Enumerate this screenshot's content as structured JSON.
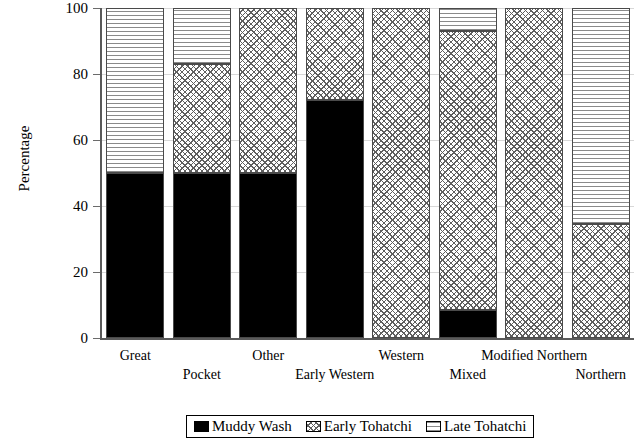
{
  "chart_data": {
    "type": "bar",
    "subtype": "stacked-100-percent",
    "title": "",
    "xlabel": "",
    "ylabel": "Percentage",
    "ylim": [
      0,
      100
    ],
    "yticks": [
      0,
      20,
      40,
      60,
      80,
      100
    ],
    "grid": true,
    "legend_position": "bottom-center",
    "categories": [
      "Great",
      "Pocket",
      "Other",
      "Early Western",
      "Western",
      "Mixed",
      "Modified Northern",
      "Northern"
    ],
    "category_label_rows": [
      0,
      1,
      0,
      1,
      0,
      1,
      0,
      1
    ],
    "series": [
      {
        "name": "Muddy Wash",
        "pattern": "solid-black",
        "color": "#000000",
        "values": [
          50,
          50,
          50,
          72,
          0,
          8.5,
          0,
          0
        ]
      },
      {
        "name": "Early Tohatchi",
        "pattern": "cross-hatch",
        "color": "#ffffff",
        "values": [
          0,
          33,
          50,
          28,
          100,
          84.5,
          100,
          34.5
        ]
      },
      {
        "name": "Late Tohatchi",
        "pattern": "horizontal-lines",
        "color": "#ffffff",
        "values": [
          50,
          17,
          0,
          0,
          0,
          7,
          0,
          65.5
        ]
      }
    ]
  },
  "axis": {
    "y_title": "Percentage",
    "y_tick_labels": [
      "0",
      "20",
      "40",
      "60",
      "80",
      "100"
    ]
  },
  "legend": {
    "items": [
      {
        "label": "Muddy Wash",
        "pattern": "solid-black"
      },
      {
        "label": "Early Tohatchi",
        "pattern": "cross-hatch"
      },
      {
        "label": "Late Tohatchi",
        "pattern": "horizontal-lines"
      }
    ]
  }
}
